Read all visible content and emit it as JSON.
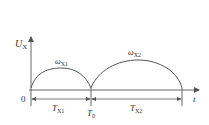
{
  "diagram": {
    "y_axis_label": "U",
    "y_axis_sub": "X",
    "x_axis_label": "t",
    "origin_label": "0",
    "arch1_label": "ω",
    "arch1_sub": "X1",
    "arch2_label": "ω",
    "arch2_sub": "X2",
    "period1_label": "T",
    "period1_sub": "X1",
    "period2_label": "T",
    "period2_sub": "X2",
    "boundary_label": "T",
    "boundary_sub": "0",
    "colors": {
      "line": "#555555",
      "axis": "#666666",
      "text": "#333333"
    }
  }
}
